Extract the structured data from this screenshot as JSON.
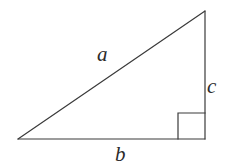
{
  "figure": {
    "kind": "right-triangle-diagram",
    "background_color": "#ffffff",
    "stroke_color": "#3a3a3a",
    "label_color": "#2b2b2b",
    "stroke_width": 1.2
  },
  "geometry": {
    "vertices": {
      "left": {
        "x": 18,
        "y": 139
      },
      "apex": {
        "x": 205,
        "y": 11
      },
      "corner": {
        "x": 205,
        "y": 139
      }
    },
    "right_angle_marker": {
      "x": 178,
      "y": 113,
      "width": 27,
      "height": 26,
      "at_vertex": "corner"
    }
  },
  "labels": {
    "hypotenuse": "a",
    "base": "b",
    "vertical": "c"
  }
}
